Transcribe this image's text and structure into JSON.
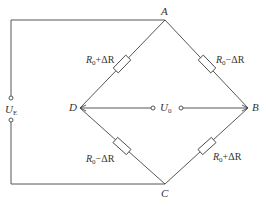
{
  "diagram": {
    "type": "wheatstone-bridge",
    "nodes": {
      "A": {
        "label": "A"
      },
      "B": {
        "label": "B"
      },
      "C": {
        "label": "C"
      },
      "D": {
        "label": "D"
      }
    },
    "supply": {
      "symbol": "U",
      "subscript": "E"
    },
    "output": {
      "symbol": "U",
      "subscript": "0"
    },
    "resistors": {
      "AD": {
        "base": "R",
        "sub": "0",
        "suffix": "+ΔR"
      },
      "AB": {
        "base": "R",
        "sub": "0",
        "suffix": "−ΔR"
      },
      "DC": {
        "base": "R",
        "sub": "0",
        "suffix": "−ΔR"
      },
      "BC": {
        "base": "R",
        "sub": "0",
        "suffix": "+ΔR"
      }
    },
    "colors": {
      "line": "#444444",
      "background": "#ffffff",
      "text": "#333333"
    }
  }
}
